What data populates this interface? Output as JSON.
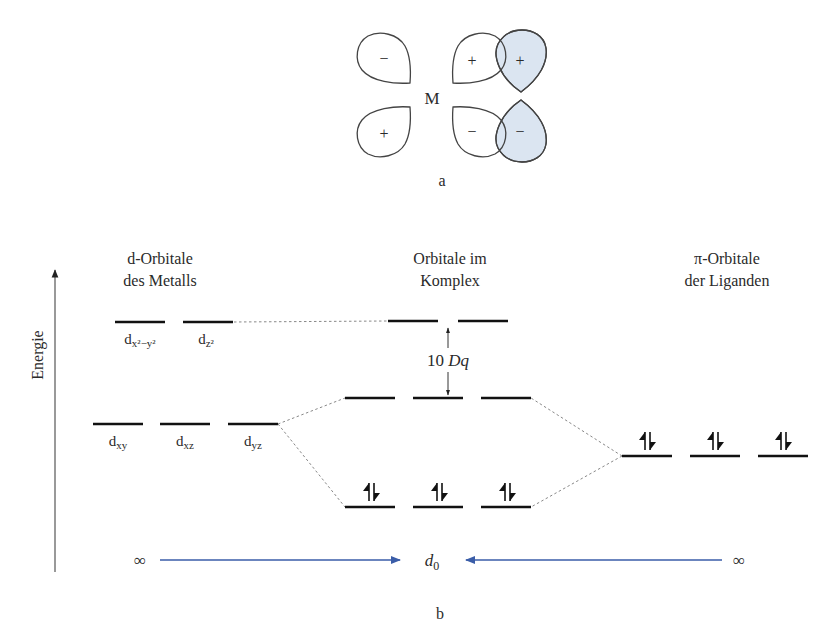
{
  "figure_a": {
    "label": "a",
    "center_label": "M",
    "metal_lobes": [
      {
        "position": "upper-left",
        "sign": "−"
      },
      {
        "position": "lower-left",
        "sign": "+"
      },
      {
        "position": "upper-right",
        "sign": "+"
      },
      {
        "position": "lower-right",
        "sign": "−"
      }
    ],
    "ligand_lobes": [
      {
        "position": "upper-right",
        "sign": "+"
      },
      {
        "position": "lower-right",
        "sign": "−"
      }
    ],
    "ligand_fill_color": "#dbe5f1"
  },
  "figure_b": {
    "label": "b",
    "axis_label": "Energie",
    "columns": {
      "metal": {
        "line1": "d-Orbitale",
        "line2": "des Metalls"
      },
      "complex": {
        "line1": "Orbitale im",
        "line2": "Komplex"
      },
      "ligand": {
        "line1": "π-Orbitale",
        "line2": "der Liganden"
      }
    },
    "metal_eg": [
      {
        "base": "d",
        "sub": "x²−y²"
      },
      {
        "base": "d",
        "sub": "z²"
      }
    ],
    "metal_t2g": [
      {
        "base": "d",
        "sub": "xy"
      },
      {
        "base": "d",
        "sub": "xz"
      },
      {
        "base": "d",
        "sub": "yz"
      }
    ],
    "splitting_label": {
      "num": "10 ",
      "sym": "Dq"
    },
    "electron_pair": "↿⇂",
    "bottom": {
      "left_symbol": "∞",
      "right_symbol": "∞",
      "center_base": "d",
      "center_sub": "0",
      "arrow_color": "#3a5da8"
    }
  }
}
